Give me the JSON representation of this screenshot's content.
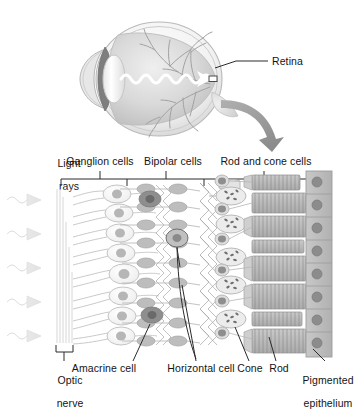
{
  "figure": {
    "type": "anatomical-diagram"
  },
  "eye_diagram": {
    "retina_label": "Retina",
    "parts": [
      "cornea",
      "lens",
      "iris",
      "vitreous-humor",
      "retina",
      "optic-nerve",
      "blood-vessels"
    ],
    "light_path_label": ""
  },
  "retina_diagram": {
    "left_label_line1": "Light",
    "left_label_line2": "rays",
    "top_labels": [
      {
        "text": "Ganglion cells",
        "tick_x": 100,
        "text_x": 100
      },
      {
        "text": "Bipolar cells",
        "tick_x": 166,
        "text_x": 173
      },
      {
        "text": "Rod and cone cells",
        "tick_x": 264,
        "text_x": 266
      }
    ],
    "bracket": {
      "left": 61,
      "right": 325,
      "dividers": [
        127,
        204
      ]
    },
    "bottom_labels": [
      {
        "text_line1": "Optic",
        "text_line2": "nerve",
        "text_x": 47,
        "anchor": "start",
        "leader": "bracket"
      },
      {
        "text_line1": "Amacrine cell",
        "text_line2": "",
        "text_x": 104,
        "anchor": "middle",
        "leader": "line"
      },
      {
        "text_line1": "Horizontal cell",
        "text_line2": "",
        "text_x": 201,
        "anchor": "middle",
        "leader": "line"
      },
      {
        "text_line1": "Cone",
        "text_line2": "",
        "text_x": 250,
        "anchor": "middle",
        "leader": "line"
      },
      {
        "text_line1": "Rod",
        "text_line2": "",
        "text_x": 278,
        "anchor": "middle",
        "leader": "line"
      },
      {
        "text_line1": "Pigmented",
        "text_line2": "epithelium",
        "text_x": 321,
        "anchor": "middle",
        "leader": "line"
      }
    ],
    "light_ray_count": 5,
    "photoreceptor_row_count": 7
  },
  "colors": {
    "background": "#ffffff",
    "text": "#141414",
    "outline": "#8f8f8f",
    "light_gray": "#dedede",
    "mid_gray": "#b4b4b4",
    "dark_gray": "#7d7d7d",
    "cell_fill": "#f2f2f2",
    "nucleus": "#a8a8a8",
    "epithelium": "#bdbdbd",
    "arrow": "#8a8a8a"
  }
}
